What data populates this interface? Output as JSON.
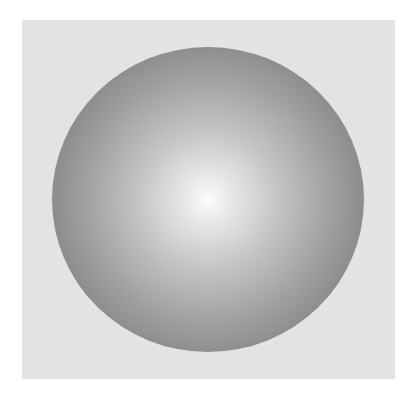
{
  "scene": {
    "background_color": "#ffffff",
    "panel_color": "#e3e3e3",
    "sphere": {
      "highlight_color": "#fbfbfb",
      "edge_color": "#6c6c6c",
      "shape": "shaded-sphere"
    }
  }
}
